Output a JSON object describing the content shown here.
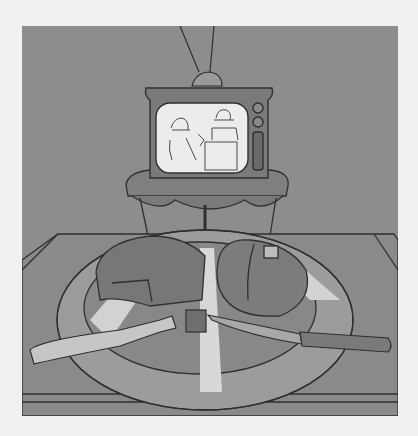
{
  "illustration": {
    "subject": "TV dinner",
    "colors": {
      "page_background": "#f1f1f1",
      "wall": "#8d8d8d",
      "tray": "#8a8a8a",
      "plate": "#cfcfcf",
      "screen": "#ececec",
      "line": "#2f2f2f"
    },
    "elements": [
      "television",
      "antenna",
      "tv-table",
      "dinner-tray",
      "plate",
      "meatloaf",
      "baked-potato",
      "fork",
      "knife",
      "meat-cube"
    ]
  }
}
